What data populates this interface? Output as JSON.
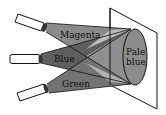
{
  "diagram": {
    "labels": {
      "magenta": "Magenta",
      "blue": "Blue",
      "green": "Green",
      "result_line1": "Pale",
      "result_line2": "blue"
    },
    "colors": {
      "magenta_beam": "#8a8a8a",
      "blue_beam": "#5e5e5e",
      "green_beam": "#707070",
      "overlap_light": "#b8b8b8",
      "overlap_mid": "#9a9a9a",
      "spot": "#8c8c8c",
      "outline": "#111111",
      "background": "#ffffff"
    }
  }
}
